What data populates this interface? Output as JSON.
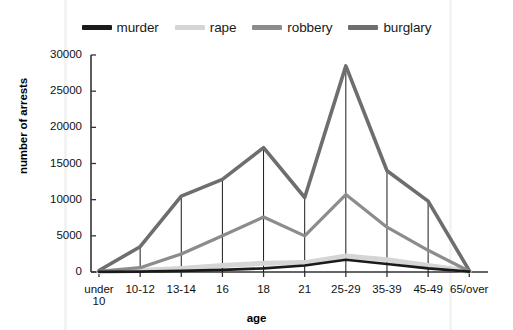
{
  "chart_data": {
    "type": "line",
    "title": "",
    "xlabel": "age",
    "ylabel": "number of arrests",
    "categories": [
      "under 10",
      "10-12",
      "13-14",
      "16",
      "18",
      "21",
      "25-29",
      "35-39",
      "45-49",
      "65/over"
    ],
    "ylim": [
      0,
      30000
    ],
    "yticks": [
      0,
      5000,
      10000,
      15000,
      20000,
      25000,
      30000
    ],
    "ytick_labels": [
      "0",
      "5000",
      "10000",
      "15000",
      "20000",
      "25000",
      "30000"
    ],
    "grid": false,
    "legend_position": "top",
    "series": [
      {
        "name": "murder",
        "color": "#1a1a1a",
        "values": [
          30,
          50,
          150,
          300,
          500,
          900,
          1700,
          1100,
          500,
          50
        ]
      },
      {
        "name": "rape",
        "color": "#d5d5d5",
        "values": [
          50,
          200,
          500,
          900,
          1200,
          1300,
          2200,
          1700,
          900,
          100
        ]
      },
      {
        "name": "robbery",
        "color": "#8c8c8c",
        "values": [
          100,
          600,
          2500,
          5000,
          7600,
          5000,
          10700,
          6200,
          3000,
          100
        ]
      },
      {
        "name": "burglary",
        "color": "#6e6e6e",
        "values": [
          200,
          3500,
          10500,
          12800,
          17200,
          10300,
          28500,
          14000,
          9800,
          200
        ]
      }
    ]
  },
  "legend": {
    "entries": [
      {
        "label": "murder"
      },
      {
        "label": "rape"
      },
      {
        "label": "robbery"
      },
      {
        "label": "burglary"
      }
    ]
  },
  "axes": {
    "x_title": "age",
    "y_title": "number of arrests"
  }
}
